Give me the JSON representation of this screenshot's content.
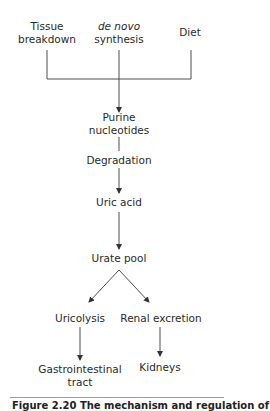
{
  "diagram": {
    "sources": [
      {
        "id": "tissue",
        "line1": "Tissue",
        "line2": "breakdown"
      },
      {
        "id": "denovo",
        "line1": "de novo",
        "line2": "synthesis",
        "italic_line1": true
      },
      {
        "id": "diet",
        "line1": "Diet"
      }
    ],
    "nodes": {
      "purine": {
        "line1": "Purine",
        "line2": "nucleotides"
      },
      "degradation": {
        "label": "Degradation"
      },
      "uric_acid": {
        "label": "Uric acid"
      },
      "urate_pool": {
        "label": "Urate pool"
      },
      "uricolysis": {
        "label": "Uricolysis"
      },
      "renal": {
        "label": "Renal excretion"
      },
      "gi": {
        "line1": "Gastrointestinal",
        "line2": "tract"
      },
      "kidneys": {
        "label": "Kidneys"
      }
    },
    "edges": [
      {
        "from": "tissue",
        "to": "purine"
      },
      {
        "from": "denovo",
        "to": "purine"
      },
      {
        "from": "diet",
        "to": "purine"
      },
      {
        "from": "purine",
        "to": "uric_acid",
        "via": "degradation"
      },
      {
        "from": "uric_acid",
        "to": "urate_pool"
      },
      {
        "from": "urate_pool",
        "to": "uricolysis"
      },
      {
        "from": "urate_pool",
        "to": "renal"
      },
      {
        "from": "uricolysis",
        "to": "gi"
      },
      {
        "from": "renal",
        "to": "kidneys"
      }
    ],
    "line_color": "#3a3a3a"
  },
  "caption": {
    "text": "Figure 2.20 The mechanism and regulation of",
    "partially_visible": true
  }
}
